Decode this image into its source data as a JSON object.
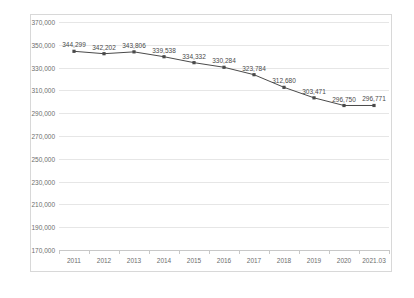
{
  "chart": {
    "title": "",
    "title_note": "clipped at top edge of screenshot, illegible"
  },
  "chart_data": {
    "type": "line",
    "title": "",
    "xlabel": "",
    "ylabel": "",
    "categories": [
      "2011",
      "2012",
      "2013",
      "2014",
      "2015",
      "2016",
      "2017",
      "2018",
      "2019",
      "2020",
      "2021.03"
    ],
    "values": [
      344299,
      342202,
      343806,
      339538,
      334332,
      330284,
      323784,
      312680,
      303471,
      296750,
      296771
    ],
    "point_labels": [
      "344,299",
      "342,202",
      "343,806",
      "339,538",
      "334,332",
      "330,284",
      "323,784",
      "312,680",
      "303,471",
      "296,750",
      "296,771"
    ],
    "ylim": [
      170000,
      370000
    ],
    "ytick_step": 20000,
    "ytick_labels": [
      "370,000",
      "350,000",
      "330,000",
      "310,000",
      "290,000",
      "270,000",
      "250,000",
      "230,000",
      "210,000",
      "190,000",
      "170,000"
    ],
    "ytick_values": [
      370000,
      350000,
      330000,
      310000,
      290000,
      270000,
      250000,
      230000,
      210000,
      190000,
      170000
    ],
    "grid": true,
    "legend": null,
    "series_color": "#4a4a4a",
    "grid_color": "#e6e6e6",
    "axis_color": "#c8c8c8",
    "plot_background": "#ffffff",
    "frame_border_color": "#d8d8d8"
  }
}
